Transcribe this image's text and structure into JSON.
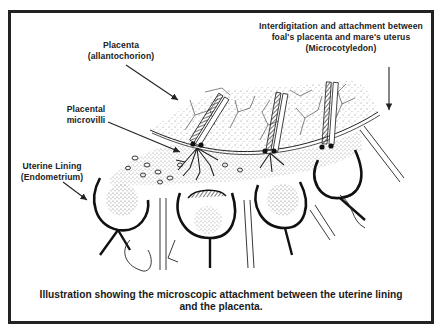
{
  "figure": {
    "type": "anatomical-illustration"
  },
  "labels": {
    "microcotyledon": {
      "line1": "Interdigitation and attachment between",
      "line2": "foal's placenta and mare's uterus",
      "line3": "(Microcotyledon)"
    },
    "placenta": {
      "line1": "Placenta",
      "line2": "(allantochorion)"
    },
    "microvilli": {
      "line1": "Placental",
      "line2": "microvilli"
    },
    "uterine_lining": {
      "line1": "Uterine Lining",
      "line2": "(Endometrium)"
    }
  },
  "caption": {
    "line1": "Illustration showing the microscopic attachment between the uterine lining",
    "line2": "and the placenta."
  },
  "colors": {
    "ink": "#222222",
    "background": "#ffffff",
    "frame": "#222222"
  }
}
